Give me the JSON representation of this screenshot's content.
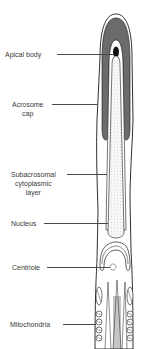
{
  "diagram": {
    "colors": {
      "acrosome_fill": "#6b6b6b",
      "apical_body_fill": "#111111",
      "outline": "#1a1a1a",
      "nucleus_stipple": "#bdbdbd",
      "background": "#ffffff",
      "label_text": "#3a3a3a"
    },
    "labels": [
      {
        "id": "apical-body",
        "lines": [
          "Apical body"
        ]
      },
      {
        "id": "acrosome-cap",
        "lines": [
          "Acrosome",
          "cap"
        ]
      },
      {
        "id": "subacrosomal-layer",
        "lines": [
          "Subacrosomal",
          "cytoplasmic",
          "layer"
        ]
      },
      {
        "id": "nucleus",
        "lines": [
          "Nucleus"
        ]
      },
      {
        "id": "centriole",
        "lines": [
          "Centriole"
        ]
      },
      {
        "id": "mitochondria",
        "lines": [
          "Mitochondria"
        ]
      }
    ]
  }
}
